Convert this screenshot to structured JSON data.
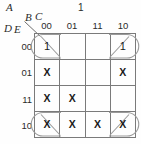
{
  "diagram": {
    "type": "karnaugh-map",
    "title_vars": {
      "a": "A",
      "b": "B",
      "c": "C",
      "d": "D",
      "e": "E"
    },
    "top_group_label": "1",
    "column_headers": [
      "00",
      "01",
      "11",
      "10"
    ],
    "row_headers": [
      "00",
      "01",
      "11",
      "10"
    ],
    "colors": {
      "grid_line": "#7a7a7a",
      "text": "#1a1a1a",
      "group_outline": "#9a9a9a",
      "background": "#fefefe"
    },
    "cells": [
      [
        {
          "value": "1",
          "grouped": true,
          "group_side": "left"
        },
        {
          "value": "",
          "grouped": false,
          "group_side": ""
        },
        {
          "value": "",
          "grouped": false,
          "group_side": ""
        },
        {
          "value": "1",
          "grouped": true,
          "group_side": "right"
        }
      ],
      [
        {
          "value": "X",
          "grouped": false,
          "group_side": ""
        },
        {
          "value": "",
          "grouped": false,
          "group_side": ""
        },
        {
          "value": "",
          "grouped": false,
          "group_side": ""
        },
        {
          "value": "X",
          "grouped": false,
          "group_side": ""
        }
      ],
      [
        {
          "value": "X",
          "grouped": false,
          "group_side": ""
        },
        {
          "value": "X",
          "grouped": false,
          "group_side": ""
        },
        {
          "value": "",
          "grouped": false,
          "group_side": ""
        },
        {
          "value": "",
          "grouped": false,
          "group_side": ""
        }
      ],
      [
        {
          "value": "X",
          "grouped": true,
          "group_side": "left"
        },
        {
          "value": "X",
          "grouped": false,
          "group_side": ""
        },
        {
          "value": "X",
          "grouped": false,
          "group_side": ""
        },
        {
          "value": "X",
          "grouped": true,
          "group_side": "right"
        }
      ]
    ]
  }
}
